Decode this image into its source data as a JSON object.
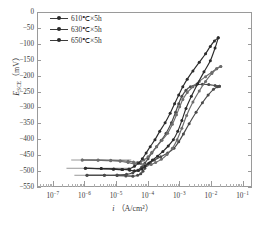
{
  "figure": {
    "background": "#ffffff",
    "frame_color": "#9a9a9a"
  },
  "legend": {
    "position": "upper-left",
    "items": [
      {
        "label": "610℃×5h",
        "color": "#4a4a4a",
        "marker": "filled-circle"
      },
      {
        "label": "630℃×5h",
        "color": "#6d6d6d",
        "marker": "filled-circle"
      },
      {
        "label": "650℃×5h",
        "color": "#2b2b2b",
        "marker": "filled-circle"
      }
    ]
  },
  "axes": {
    "y": {
      "title_main": "E",
      "title_sub": "SCE",
      "title_unit": "（mV）",
      "ticks": [
        "0",
        "−50",
        "−100",
        "−150",
        "−200",
        "−250",
        "−300",
        "−350",
        "−400",
        "−450",
        "−500",
        "−550"
      ],
      "min": -550,
      "max": 0
    },
    "x": {
      "title_main": "i",
      "title_unit": "（A/cm²）",
      "ticks": [
        {
          "base": "10",
          "exp": "−7"
        },
        {
          "base": "10",
          "exp": "−6"
        },
        {
          "base": "10",
          "exp": "−5"
        },
        {
          "base": "10",
          "exp": "−4"
        },
        {
          "base": "10",
          "exp": "−3"
        },
        {
          "base": "10",
          "exp": "−2"
        },
        {
          "base": "10",
          "exp": "−1"
        }
      ],
      "min_exp": -7.5,
      "max_exp": -0.7
    }
  },
  "chart_data": {
    "type": "line",
    "title": "",
    "xlabel": "i (A/cm2)",
    "ylabel": "E_SCE (mV)",
    "xscale": "log",
    "xlim": [
      -7.5,
      -0.7
    ],
    "ylim": [
      -550,
      0
    ],
    "grid": false,
    "legend_position": "upper left",
    "note": "Cyclic potentiodynamic polarization curves; x values are log10(current density in A/cm2), y values are potential in mV vs SCE. Each series is a closed hysteresis loop traced forward (anodic) then reverse.",
    "series": [
      {
        "name": "610℃×5h",
        "color": "#4a4a4a",
        "marker": "filled-circle",
        "corrosion_potential_mV": -510,
        "forward": {
          "x": [
            -5.95,
            -5.4,
            -5.0,
            -4.72,
            -4.5,
            -4.35,
            -4.25,
            -4.18,
            -4.12,
            -4.05,
            -3.95,
            -3.82,
            -3.62,
            -3.4,
            -3.2,
            -3.05,
            -2.9,
            -2.72,
            -2.5,
            -2.3,
            -2.12,
            -1.95,
            -1.82,
            -1.76
          ],
          "y": [
            -510,
            -510,
            -511,
            -512,
            -513,
            -510,
            -505,
            -497,
            -488,
            -478,
            -470,
            -462,
            -452,
            -440,
            -425,
            -405,
            -380,
            -348,
            -312,
            -282,
            -258,
            -240,
            -232,
            -230
          ]
        },
        "reverse": {
          "x": [
            -1.76,
            -1.9,
            -2.1,
            -2.3,
            -2.5,
            -2.68,
            -2.82,
            -2.95,
            -3.05,
            -3.15,
            -3.28,
            -3.45,
            -3.6,
            -3.75,
            -3.9,
            -4.02,
            -4.12,
            -4.22,
            -4.35,
            -4.5,
            -4.7,
            -5.0,
            -5.4,
            -5.95
          ],
          "y": [
            -230,
            -228,
            -225,
            -224,
            -226,
            -232,
            -243,
            -262,
            -285,
            -312,
            -345,
            -378,
            -400,
            -420,
            -440,
            -458,
            -472,
            -484,
            -494,
            -502,
            -507,
            -509,
            -510,
            -510
          ]
        }
      },
      {
        "name": "630℃×5h",
        "color": "#6d6d6d",
        "marker": "filled-circle",
        "corrosion_potential_mV": -462,
        "forward": {
          "x": [
            -6.1,
            -5.6,
            -5.2,
            -4.9,
            -4.65,
            -4.48,
            -4.35,
            -4.25,
            -4.15,
            -4.05,
            -3.92,
            -3.78,
            -3.6,
            -3.42,
            -3.25,
            -3.1,
            -2.95,
            -2.8,
            -2.6,
            -2.4,
            -2.2,
            -2.0,
            -1.85,
            -1.72
          ],
          "y": [
            -462,
            -462,
            -463,
            -464,
            -466,
            -468,
            -470,
            -473,
            -476,
            -478,
            -476,
            -470,
            -460,
            -445,
            -425,
            -398,
            -362,
            -322,
            -280,
            -245,
            -215,
            -190,
            -175,
            -168
          ]
        },
        "reverse": {
          "x": [
            -1.72,
            -1.85,
            -2.0,
            -2.2,
            -2.4,
            -2.6,
            -2.78,
            -2.92,
            -3.02,
            -3.12,
            -3.25,
            -3.4,
            -3.58,
            -3.75,
            -3.9,
            -4.02,
            -4.15,
            -4.28,
            -4.45,
            -4.65,
            -4.9,
            -5.2,
            -5.6,
            -6.1
          ],
          "y": [
            -168,
            -175,
            -186,
            -200,
            -215,
            -232,
            -250,
            -272,
            -295,
            -320,
            -350,
            -378,
            -400,
            -420,
            -438,
            -452,
            -462,
            -470,
            -474,
            -470,
            -466,
            -464,
            -463,
            -462
          ]
        }
      },
      {
        "name": "650℃×5h",
        "color": "#2b2b2b",
        "marker": "filled-circle",
        "corrosion_potential_mV": -488,
        "forward": {
          "x": [
            -6.0,
            -5.5,
            -5.1,
            -4.82,
            -4.6,
            -4.45,
            -4.32,
            -4.22,
            -4.12,
            -4.0,
            -3.88,
            -3.72,
            -3.55,
            -3.38,
            -3.22,
            -3.08,
            -2.95,
            -2.82,
            -2.65,
            -2.45,
            -2.25,
            -2.05,
            -1.9,
            -1.8
          ],
          "y": [
            -488,
            -489,
            -490,
            -492,
            -494,
            -496,
            -495,
            -490,
            -482,
            -472,
            -462,
            -450,
            -435,
            -418,
            -398,
            -372,
            -338,
            -300,
            -262,
            -222,
            -185,
            -150,
            -110,
            -78
          ]
        },
        "reverse": {
          "x": [
            -1.8,
            -1.92,
            -2.05,
            -2.2,
            -2.4,
            -2.6,
            -2.78,
            -2.92,
            -3.05,
            -3.18,
            -3.32,
            -3.48,
            -3.65,
            -3.8,
            -3.95,
            -4.08,
            -4.2,
            -4.32,
            -4.45,
            -4.62,
            -4.85,
            -5.12,
            -5.5,
            -6.0
          ],
          "y": [
            -78,
            -88,
            -105,
            -128,
            -155,
            -182,
            -208,
            -232,
            -258,
            -285,
            -315,
            -345,
            -372,
            -398,
            -420,
            -440,
            -458,
            -472,
            -482,
            -490,
            -492,
            -491,
            -489,
            -488
          ]
        }
      }
    ],
    "baseline_tails": [
      {
        "series": "630℃×5h",
        "y": -462,
        "x_from": -6.45,
        "x_to": -4.55
      },
      {
        "series": "650℃×5h",
        "y": -488,
        "x_from": -6.6,
        "x_to": -4.6
      },
      {
        "series": "610℃×5h",
        "y": -510,
        "x_from": -6.35,
        "x_to": -4.45
      }
    ]
  }
}
